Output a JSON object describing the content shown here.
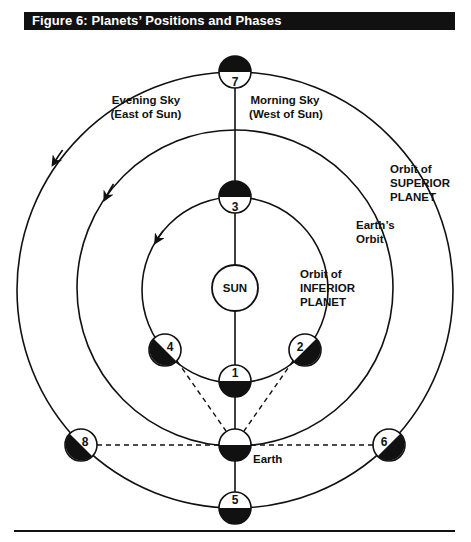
{
  "figure": {
    "title": "Figure 6: Planets’ Positions and Phases"
  },
  "labels": {
    "evening_sky_line1": "Evening Sky",
    "evening_sky_line2": "(East of Sun)",
    "morning_sky_line1": "Morning Sky",
    "morning_sky_line2": "(West of Sun)",
    "superior_orbit_line1": "Orbit of",
    "superior_orbit_line2": "SUPERIOR",
    "superior_orbit_line3": "PLANET",
    "earth_orbit_line1": "Earth’s",
    "earth_orbit_line2": "Orbit",
    "inferior_orbit_line1": "Orbit of",
    "inferior_orbit_line2": "INFERIOR",
    "inferior_orbit_line3": "PLANET",
    "sun": "SUN",
    "earth": "Earth"
  },
  "orbits": [
    {
      "name": "Orbit of SUPERIOR PLANET",
      "radius": 218
    },
    {
      "name": "Earth's Orbit",
      "radius": 158
    },
    {
      "name": "Orbit of INFERIOR PLANET",
      "radius": 93
    }
  ],
  "positions": [
    {
      "number": "1",
      "orbit": "inferior",
      "dark_side": "bottom"
    },
    {
      "number": "2",
      "orbit": "inferior",
      "dark_side": "lower-right"
    },
    {
      "number": "3",
      "orbit": "inferior",
      "dark_side": "top"
    },
    {
      "number": "4",
      "orbit": "inferior",
      "dark_side": "lower-left"
    },
    {
      "number": "5",
      "orbit": "superior",
      "dark_side": "bottom"
    },
    {
      "number": "6",
      "orbit": "superior",
      "dark_side": "lower-right"
    },
    {
      "number": "7",
      "orbit": "superior",
      "dark_side": "top"
    },
    {
      "number": "8",
      "orbit": "superior",
      "dark_side": "lower-left"
    }
  ],
  "colors": {
    "ink": "#111111",
    "background": "#ffffff"
  }
}
